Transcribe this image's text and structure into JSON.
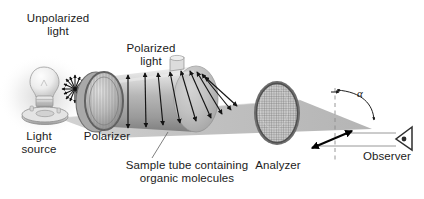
{
  "figure": {
    "background_color": "#ffffff",
    "ink_color": "#1b1b1b",
    "beam_color": "#b4b4b4",
    "metal_light": "#e6e6e6",
    "metal_mid": "#b9b9b9",
    "metal_dark": "#8a8a8a"
  },
  "labels": {
    "unpolarized_light": "Unpolarized\nlight",
    "polarized_light": "Polarized\nlight",
    "light_source": "Light\nsource",
    "polarizer": "Polarizer",
    "sample_tube": "Sample tube containing\norganic molecules",
    "analyzer": "Analyzer",
    "observer": "Observer",
    "angle_symbol": "α"
  },
  "components": [
    {
      "name": "light-source",
      "label": "Light\nsource"
    },
    {
      "name": "polarizer",
      "label": "Polarizer"
    },
    {
      "name": "sample-tube",
      "label": "Sample tube containing\norganic molecules"
    },
    {
      "name": "analyzer",
      "label": "Analyzer"
    },
    {
      "name": "observer",
      "label": "Observer"
    }
  ],
  "annotations": {
    "rotation_angle": "α",
    "unpolarized_vibration_planes": 8,
    "polarized_arrow_count": 9
  }
}
